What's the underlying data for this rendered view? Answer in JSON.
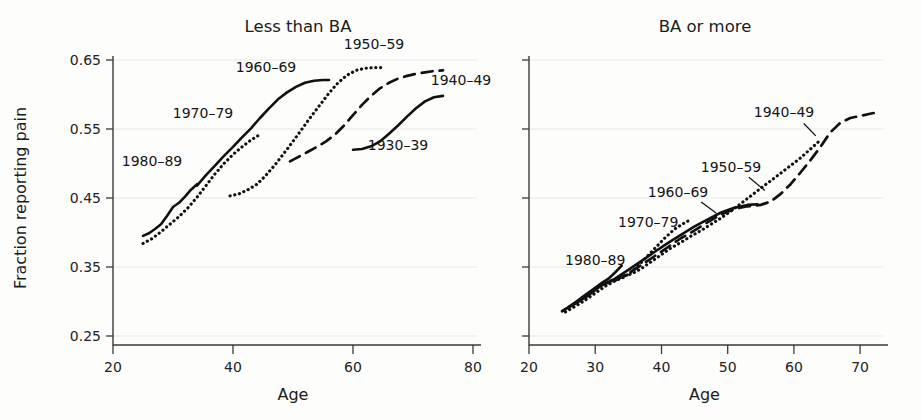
{
  "figure": {
    "background_color": "#fdfdfc",
    "ink_color": "#111111",
    "grid_color": "#e9e9e6"
  },
  "axis": {
    "x_title": "Age",
    "y_title": "Fraction reporting pain"
  },
  "chart_data": [
    {
      "type": "line",
      "title": "Less than BA",
      "xlabel": "Age",
      "ylabel": "Fraction reporting pain",
      "xlim": [
        20,
        80
      ],
      "ylim": [
        0.25,
        0.65
      ],
      "xticks": [
        20,
        40,
        60,
        80
      ],
      "yticks": [
        0.25,
        0.35,
        0.45,
        0.55,
        0.65
      ],
      "xtick_labels": [
        "20",
        "40",
        "60",
        "80"
      ],
      "ytick_labels": [
        "0.25",
        "0.35",
        "0.45",
        "0.55",
        "0.65"
      ],
      "grid": "horizontal",
      "legend": "inline-annotations",
      "series": [
        {
          "name": "1980-89",
          "style": "solid",
          "label": "1980–89",
          "label_x": 26.5,
          "label_y": 0.497,
          "x": [
            25.0,
            26.0,
            27.0,
            28.0,
            29.0,
            30.0,
            31.0,
            32.0,
            33.0,
            34.0
          ],
          "y": [
            0.395,
            0.399,
            0.405,
            0.412,
            0.424,
            0.437,
            0.443,
            0.452,
            0.462,
            0.47
          ]
        },
        {
          "name": "1970-79",
          "style": "dotted",
          "label": "1970–79",
          "label_x": 35.0,
          "label_y": 0.566,
          "x": [
            25.0,
            26.5,
            28.0,
            29.5,
            31.0,
            32.5,
            34.0,
            35.5,
            37.0,
            38.5,
            40.0,
            41.5,
            43.0,
            44.5
          ],
          "y": [
            0.384,
            0.391,
            0.401,
            0.412,
            0.423,
            0.436,
            0.451,
            0.468,
            0.485,
            0.5,
            0.513,
            0.524,
            0.534,
            0.542
          ]
        },
        {
          "name": "1960-69",
          "style": "solid",
          "label": "1960–69",
          "label_x": 45.5,
          "label_y": 0.633,
          "x": [
            34.0,
            35.5,
            37.0,
            38.5,
            40.0,
            41.5,
            43.0,
            44.5,
            46.0,
            47.5,
            49.0,
            50.5,
            52.0,
            53.5,
            55.0,
            56.0
          ],
          "y": [
            0.468,
            0.483,
            0.497,
            0.511,
            0.524,
            0.538,
            0.551,
            0.566,
            0.58,
            0.593,
            0.603,
            0.611,
            0.617,
            0.62,
            0.621,
            0.621
          ]
        },
        {
          "name": "1950-59",
          "style": "dotted",
          "label": "1950–59",
          "label_x": 63.5,
          "label_y": 0.666,
          "x": [
            39.5,
            41.0,
            42.5,
            44.0,
            45.5,
            47.0,
            48.5,
            50.0,
            51.5,
            53.0,
            54.5,
            56.0,
            57.5,
            59.0,
            60.5,
            62.0,
            63.5,
            65.0
          ],
          "y": [
            0.453,
            0.456,
            0.462,
            0.47,
            0.483,
            0.498,
            0.515,
            0.532,
            0.55,
            0.568,
            0.585,
            0.602,
            0.617,
            0.628,
            0.635,
            0.638,
            0.639,
            0.639
          ]
        },
        {
          "name": "1940-49",
          "style": "dashed",
          "label": "1940–49",
          "label_x": 78.0,
          "label_y": 0.614,
          "x": [
            49.5,
            51.0,
            52.5,
            54.0,
            55.5,
            57.0,
            58.5,
            60.0,
            61.5,
            63.0,
            64.5,
            66.0,
            67.5,
            69.0,
            70.5,
            72.0,
            73.5,
            75.0
          ],
          "y": [
            0.503,
            0.51,
            0.517,
            0.524,
            0.532,
            0.542,
            0.555,
            0.57,
            0.585,
            0.598,
            0.609,
            0.617,
            0.623,
            0.627,
            0.63,
            0.632,
            0.634,
            0.635
          ]
        },
        {
          "name": "1930-39",
          "style": "solid",
          "label": "1930–39",
          "label_x": 67.5,
          "label_y": 0.52,
          "x": [
            60.0,
            61.5,
            63.0,
            64.5,
            66.0,
            67.5,
            69.0,
            70.5,
            72.0,
            73.5,
            75.0
          ],
          "y": [
            0.52,
            0.521,
            0.525,
            0.532,
            0.543,
            0.555,
            0.568,
            0.58,
            0.59,
            0.596,
            0.598
          ]
        }
      ]
    },
    {
      "type": "line",
      "title": "BA or more",
      "xlabel": "Age",
      "ylabel": "Fraction reporting pain",
      "xlim": [
        20,
        73
      ],
      "ylim": [
        0.25,
        0.65
      ],
      "xticks": [
        20,
        30,
        40,
        50,
        60,
        70
      ],
      "yticks": [
        0.25,
        0.35,
        0.45,
        0.55,
        0.65
      ],
      "xtick_labels": [
        "20",
        "30",
        "40",
        "50",
        "60",
        "70"
      ],
      "ytick_labels": [
        "",
        "",
        "",
        "",
        ""
      ],
      "grid": "horizontal",
      "legend": "inline-annotations",
      "series": [
        {
          "name": "1980-89",
          "style": "solid",
          "label": "1980–89",
          "label_x": 30.0,
          "label_y": 0.353,
          "leader": null,
          "x": [
            25.0,
            26.0,
            27.0,
            28.0,
            29.0,
            30.0,
            31.0,
            32.0,
            33.0,
            34.0
          ],
          "y": [
            0.286,
            0.292,
            0.299,
            0.306,
            0.313,
            0.32,
            0.327,
            0.333,
            0.342,
            0.352
          ]
        },
        {
          "name": "1970-79",
          "style": "dotted",
          "label": "1970–79",
          "label_x": 38.0,
          "label_y": 0.408,
          "leader": null,
          "x": [
            25.5,
            27.0,
            28.5,
            30.0,
            31.5,
            33.0,
            34.5,
            36.0,
            37.5,
            39.0,
            40.5,
            42.0,
            43.5,
            44.5
          ],
          "y": [
            0.285,
            0.293,
            0.302,
            0.312,
            0.322,
            0.33,
            0.336,
            0.347,
            0.362,
            0.377,
            0.392,
            0.405,
            0.414,
            0.419
          ]
        },
        {
          "name": "1960-69",
          "style": "solid",
          "label": "1960–69",
          "label_x": 42.5,
          "label_y": 0.452,
          "leader": {
            "x1": 46.0,
            "y1": 0.444,
            "x2": 48.3,
            "y2": 0.428
          },
          "x": [
            25.0,
            27.0,
            29.0,
            31.0,
            33.0,
            35.0,
            37.0,
            39.0,
            41.0,
            43.0,
            45.0,
            47.0,
            49.0,
            51.0,
            53.0,
            54.5
          ],
          "y": [
            0.286,
            0.297,
            0.309,
            0.324,
            0.333,
            0.346,
            0.359,
            0.372,
            0.385,
            0.397,
            0.409,
            0.419,
            0.429,
            0.436,
            0.44,
            0.441
          ]
        },
        {
          "name": "1950-59",
          "style": "dotted",
          "label": "1950–59",
          "label_x": 50.5,
          "label_y": 0.488,
          "leader": {
            "x1": 53.2,
            "y1": 0.48,
            "x2": 55.6,
            "y2": 0.461
          },
          "x": [
            32.5,
            34.0,
            35.5,
            37.0,
            38.5,
            40.0,
            41.5,
            43.0,
            44.5,
            46.0,
            47.5,
            49.0,
            50.5,
            52.0,
            53.5,
            55.0,
            56.5,
            58.0,
            59.5,
            61.0,
            62.5,
            64.0
          ],
          "y": [
            0.33,
            0.336,
            0.34,
            0.348,
            0.358,
            0.368,
            0.378,
            0.386,
            0.395,
            0.403,
            0.412,
            0.421,
            0.431,
            0.442,
            0.453,
            0.464,
            0.475,
            0.486,
            0.497,
            0.508,
            0.521,
            0.534
          ]
        },
        {
          "name": "1940-49",
          "style": "dashed",
          "label": "1940–49",
          "label_x": 58.5,
          "label_y": 0.568,
          "leader": {
            "x1": 61.5,
            "y1": 0.558,
            "x2": 63.3,
            "y2": 0.54
          },
          "x": [
            26.0,
            28.0,
            30.0,
            31.5,
            33.0,
            35.0,
            37.0,
            39.0,
            41.0,
            43.0,
            45.0,
            47.0,
            49.0,
            51.0,
            53.0,
            55.0,
            56.5,
            58.0,
            59.5,
            61.0,
            62.5,
            64.0,
            65.5,
            67.0,
            68.5,
            70.0,
            71.5,
            72.5
          ],
          "y": [
            0.292,
            0.304,
            0.318,
            0.326,
            0.33,
            0.341,
            0.353,
            0.366,
            0.379,
            0.392,
            0.403,
            0.415,
            0.426,
            0.434,
            0.438,
            0.44,
            0.445,
            0.456,
            0.47,
            0.487,
            0.505,
            0.524,
            0.545,
            0.559,
            0.566,
            0.569,
            0.572,
            0.574
          ]
        }
      ]
    }
  ]
}
